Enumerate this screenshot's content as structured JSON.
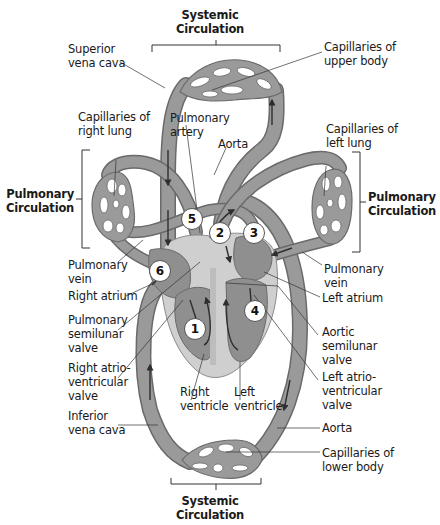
{
  "colors": {
    "vessel": "#9a9a9a",
    "vessel_dark": "#7e7e7e",
    "vessel_edge": "#6a6a6a",
    "heart_outer": "#c9c9c9",
    "heart_inner": "#8f8f8f",
    "arrow": "#2e2e2e",
    "text": "#1a1a1a",
    "background": "#ffffff"
  },
  "sections": {
    "systemic_top": "Systemic\nCirculation",
    "systemic_bottom": "Systemic\nCirculation",
    "pulmonary_left": "Pulmonary\nCirculation",
    "pulmonary_right": "Pulmonary\nCirculation"
  },
  "labels": {
    "superior_vena_cava": "Superior\nvena cava",
    "capillaries_upper_body": "Capillaries of\nupper body",
    "capillaries_right_lung": "Capillaries of\nright lung",
    "pulmonary_artery": "Pulmonary\nartery",
    "aorta_top": "Aorta",
    "capillaries_left_lung": "Capillaries of\nleft lung",
    "pulmonary_vein_left": "Pulmonary\nvein",
    "right_atrium": "Right atrium",
    "pulmonary_semilunar_valve": "Pulmonary\nsemilunar\nvalve",
    "right_av_valve": "Right atrio-\nventricular\nvalve",
    "inferior_vena_cava": "Inferior\nvena cava",
    "right_ventricle": "Right\nventricle",
    "left_ventricle": "Left\nventricle",
    "pulmonary_vein_right": "Pulmonary\nvein",
    "left_atrium": "Left atrium",
    "aortic_semilunar_valve": "Aortic\nsemilunar\nvalve",
    "left_av_valve": "Left atrio-\nventricular\nvalve",
    "aorta_bottom": "Aorta",
    "capillaries_lower_body": "Capillaries of\nlower body"
  },
  "step_numbers": [
    "1",
    "2",
    "3",
    "4",
    "5",
    "6"
  ]
}
